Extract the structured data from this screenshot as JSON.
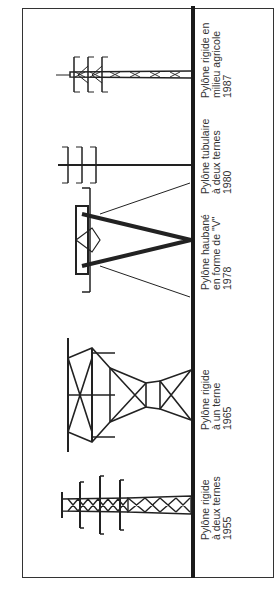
{
  "diagram": {
    "orientation": "rotated-90-ccw",
    "colors": {
      "ink": "#222222",
      "frame": "#333333",
      "background": "#ffffff"
    },
    "pylons": [
      {
        "id": "rigide-deux-ternes",
        "line1": "Pylône rigide",
        "line2": "à deux ternes",
        "year": "1955"
      },
      {
        "id": "rigide-un-terne",
        "line1": "Pylône rigide",
        "line2": "à un terne",
        "year": "1965"
      },
      {
        "id": "haubane-v",
        "line1": "Pylône haubané",
        "line2": "en forme de \"V\"",
        "year": "1978"
      },
      {
        "id": "tubulaire-deux-ternes",
        "line1": "Pylône tubulaire",
        "line2": "à deux ternes",
        "year": "1980"
      },
      {
        "id": "rigide-milieu-agricole",
        "line1": "Pylône rigide en",
        "line2": "milieu agricole",
        "year": "1987"
      }
    ]
  }
}
